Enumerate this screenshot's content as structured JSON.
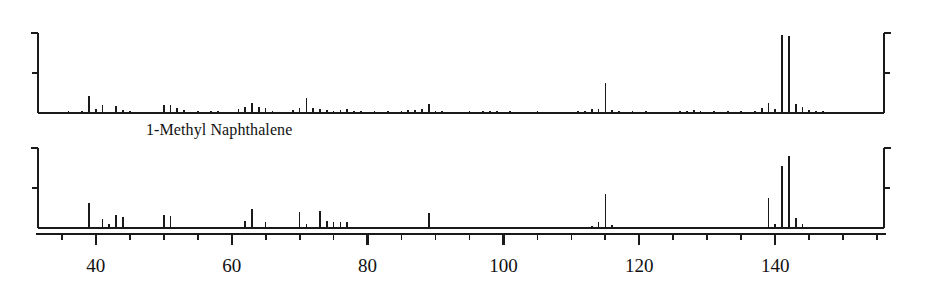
{
  "figure": {
    "compound_label": "1-Methyl Naphthalene",
    "background_color": "#ffffff",
    "line_color": "#1a1a1a"
  },
  "axis": {
    "x_tick_labels": [
      "40",
      "60",
      "80",
      "100",
      "120",
      "140"
    ],
    "x_tick_values": [
      40,
      60,
      80,
      100,
      120,
      140
    ],
    "x_minor_step": 5,
    "x_min": 31.5,
    "x_max": 156,
    "y_min": 0,
    "y_max": 100,
    "y_tick_values": [
      50,
      100
    ]
  },
  "chart_data": {
    "type": "bar",
    "title": "1-Methyl Naphthalene",
    "subtitle": "",
    "xlabel": "m/z",
    "ylabel": "Relative Abundance (%)",
    "xlim": [
      31.5,
      156
    ],
    "ylim": [
      0,
      100
    ],
    "grid": false,
    "legend": "none",
    "panels": [
      {
        "name": "experimental-scan",
        "label": "",
        "x": [
          36,
          38,
          39,
          40,
          41,
          43,
          44,
          45,
          50,
          51,
          52,
          53,
          55,
          57,
          58,
          61,
          62,
          63,
          64,
          65,
          66,
          69,
          70,
          71,
          72,
          73,
          74,
          75,
          76,
          77,
          78,
          79,
          81,
          83,
          85,
          86,
          87,
          88,
          89,
          90,
          91,
          95,
          97,
          98,
          99,
          101,
          105,
          111,
          112,
          113,
          114,
          115,
          116,
          117,
          119,
          121,
          126,
          127,
          128,
          129,
          131,
          133,
          135,
          137,
          138,
          139,
          140,
          141,
          142,
          143,
          144,
          145,
          146,
          147
        ],
        "y": [
          2,
          3,
          21,
          5,
          10,
          9,
          4,
          3,
          10,
          10,
          6,
          4,
          3,
          3,
          2,
          5,
          8,
          12,
          7,
          6,
          3,
          4,
          6,
          19,
          6,
          5,
          4,
          3,
          4,
          5,
          3,
          3,
          2,
          3,
          3,
          4,
          4,
          5,
          11,
          3,
          3,
          2,
          2,
          3,
          2,
          2,
          2,
          2,
          3,
          5,
          5,
          38,
          4,
          3,
          2,
          2,
          2,
          3,
          4,
          3,
          2,
          2,
          2,
          3,
          6,
          13,
          5,
          98,
          96,
          11,
          7,
          4,
          3,
          2
        ]
      },
      {
        "name": "library-reference",
        "label": "",
        "x": [
          39,
          41,
          42,
          43,
          44,
          50,
          51,
          62,
          63,
          65,
          70,
          71,
          73,
          74,
          75,
          76,
          77,
          89,
          113,
          114,
          115,
          116,
          139,
          140,
          141,
          142,
          143,
          144
        ],
        "y": [
          31,
          11,
          5,
          16,
          14,
          16,
          15,
          9,
          24,
          7,
          20,
          5,
          21,
          9,
          7,
          7,
          7,
          19,
          3,
          8,
          42,
          4,
          38,
          5,
          78,
          90,
          12,
          5
        ]
      }
    ]
  }
}
